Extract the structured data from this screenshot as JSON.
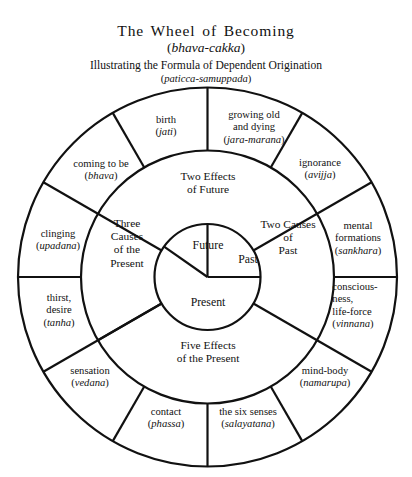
{
  "heading": {
    "title": "The Wheel of Becoming",
    "title_pali_open": "(",
    "title_pali": "bhava-cakka",
    "title_pali_close": ")",
    "subtitle": "Illustrating the Formula of Dependent Origination",
    "subtitle_pali_open": "(",
    "subtitle_pali": "paticca-samuppada",
    "subtitle_pali_close": ")"
  },
  "inner_ring": {
    "sectors": [
      {
        "label": "Future"
      },
      {
        "label": "Past"
      },
      {
        "label": "Present"
      }
    ]
  },
  "middle_ring": {
    "sectors": [
      {
        "line1": "Two Effects",
        "line2": "of Future",
        "line3": ""
      },
      {
        "line1": "Two Causes",
        "line2": "of",
        "line3": "Past"
      },
      {
        "line1": "Three",
        "line2": "Causes",
        "line3": "of the",
        "line4": "Present"
      },
      {
        "line1": "Five Effects",
        "line2": "of the Present",
        "line3": ""
      }
    ]
  },
  "outer_ring": {
    "sections": [
      {
        "en1": "birth",
        "en2": "",
        "pali": "jati"
      },
      {
        "en1": "growing old",
        "en2": "and dying",
        "pali": "jara-marana"
      },
      {
        "en1": "ignorance",
        "en2": "",
        "pali": "avijja"
      },
      {
        "en1": "mental",
        "en2": "formations",
        "pali": "sankhara"
      },
      {
        "en1": "conscious-",
        "en2": "ness,",
        "en3": "life-force",
        "pali": "vinnana"
      },
      {
        "en1": "mind-body",
        "en2": "",
        "pali": "namarupa"
      },
      {
        "en1": "the six senses",
        "en2": "",
        "pali": "salayatana"
      },
      {
        "en1": "contact",
        "en2": "",
        "pali": "phassa"
      },
      {
        "en1": "sensation",
        "en2": "",
        "pali": "vedana"
      },
      {
        "en1": "thirst,",
        "en2": "desire",
        "pali": "tanha"
      },
      {
        "en1": "clinging",
        "en2": "",
        "pali": "upadana"
      },
      {
        "en1": "coming to be",
        "en2": "",
        "pali": "bhava"
      }
    ]
  },
  "paren_open": "(",
  "paren_close": ")",
  "colors": {
    "stroke": "#111111",
    "background": "#ffffff"
  }
}
